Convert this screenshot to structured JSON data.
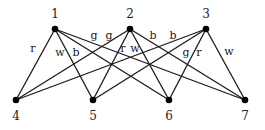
{
  "nodes": [
    {
      "id": "1",
      "label": "1",
      "x": 55,
      "y": 29,
      "lx": 55,
      "ly": 18
    },
    {
      "id": "2",
      "label": "2",
      "x": 130,
      "y": 29,
      "lx": 130,
      "ly": 18
    },
    {
      "id": "3",
      "label": "3",
      "x": 206,
      "y": 29,
      "lx": 206,
      "ly": 18
    },
    {
      "id": "4",
      "label": "4",
      "x": 16,
      "y": 100,
      "lx": 16,
      "ly": 120
    },
    {
      "id": "5",
      "label": "5",
      "x": 93,
      "y": 100,
      "lx": 93,
      "ly": 120
    },
    {
      "id": "6",
      "label": "6",
      "x": 169,
      "y": 100,
      "lx": 169,
      "ly": 120
    },
    {
      "id": "7",
      "label": "7",
      "x": 245,
      "y": 100,
      "lx": 245,
      "ly": 120
    }
  ],
  "edges": [
    {
      "from": "1",
      "to": "4",
      "color": "r"
    },
    {
      "from": "1",
      "to": "5",
      "color": "w"
    },
    {
      "from": "1",
      "to": "6",
      "color": "b"
    },
    {
      "from": "1",
      "to": "7",
      "color": "g"
    },
    {
      "from": "2",
      "to": "4",
      "color": "g"
    },
    {
      "from": "2",
      "to": "5",
      "color": "r"
    },
    {
      "from": "2",
      "to": "6",
      "color": "w"
    },
    {
      "from": "2",
      "to": "7",
      "color": "b"
    },
    {
      "from": "3",
      "to": "4",
      "color": "b"
    },
    {
      "from": "3",
      "to": "5",
      "color": "g"
    },
    {
      "from": "3",
      "to": "6",
      "color": "r"
    },
    {
      "from": "3",
      "to": "7",
      "color": "w"
    }
  ],
  "edge_labels": [
    {
      "text": "r",
      "x": 33,
      "y": 52
    },
    {
      "text": "w",
      "x": 60,
      "y": 56
    },
    {
      "text": "b",
      "x": 76,
      "y": 56
    },
    {
      "text": "g",
      "x": 94,
      "y": 39
    },
    {
      "text": "g",
      "x": 109,
      "y": 39
    },
    {
      "text": "r",
      "x": 123,
      "y": 52
    },
    {
      "text": "w",
      "x": 135,
      "y": 52
    },
    {
      "text": "b",
      "x": 153,
      "y": 39
    },
    {
      "text": "b",
      "x": 173,
      "y": 39
    },
    {
      "text": "g",
      "x": 186,
      "y": 56
    },
    {
      "text": "r",
      "x": 199,
      "y": 56
    },
    {
      "text": "w",
      "x": 229,
      "y": 55
    }
  ]
}
